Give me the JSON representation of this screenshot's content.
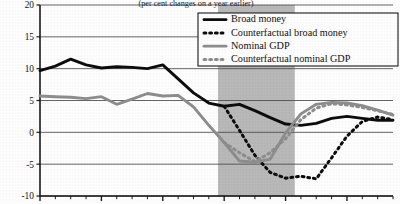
{
  "chart_data": {
    "type": "line",
    "title": "",
    "subtitle": "(per cent changes on a year earlier)",
    "xlabel": "",
    "ylabel": "",
    "xlim": [
      2006.0,
      2011.75
    ],
    "ylim": [
      -10,
      20
    ],
    "yticks": [
      20,
      15,
      10,
      5,
      0,
      -5,
      -10
    ],
    "ytick_labels": [
      "20",
      "15",
      "10",
      "5",
      "0",
      "-5",
      "-10"
    ],
    "xticks": [
      2006,
      2007,
      2008,
      2009,
      2010,
      2011
    ],
    "xtick_labels": [
      "2006",
      "2007",
      "2008",
      "2009",
      "2010",
      "2011"
    ],
    "minor_xtick_interval": 0.25,
    "grid": "horizontal",
    "legend_position": "top-right",
    "shaded_band": {
      "label": "recession",
      "x_start": 2008.9,
      "x_end": 2010.15,
      "color": "#b9b9b9"
    },
    "series": [
      {
        "name": "Broad money",
        "style": "solid",
        "color": "#0d0d0d",
        "width": 2.9,
        "x": [
          2006.0,
          2006.25,
          2006.5,
          2006.75,
          2007.0,
          2007.25,
          2007.5,
          2007.75,
          2008.0,
          2008.25,
          2008.5,
          2008.75,
          2009.0,
          2009.25,
          2009.5,
          2009.75,
          2010.0,
          2010.25,
          2010.5,
          2010.75,
          2011.0,
          2011.25,
          2011.5,
          2011.75
        ],
        "values": [
          9.7,
          10.4,
          11.5,
          10.6,
          10.1,
          10.3,
          10.2,
          10.0,
          10.6,
          8.4,
          6.2,
          4.6,
          4.1,
          4.4,
          3.4,
          2.3,
          1.3,
          1.1,
          1.4,
          2.2,
          2.5,
          2.2,
          1.9,
          1.9
        ]
      },
      {
        "name": "Counterfactual broad money",
        "style": "dotted",
        "color": "#0d0d0d",
        "width": 3.0,
        "x": [
          2009.0,
          2009.25,
          2009.5,
          2009.75,
          2010.0,
          2010.25,
          2010.5,
          2010.75,
          2011.0,
          2011.25,
          2011.5,
          2011.75
        ],
        "values": [
          4.1,
          0.3,
          -3.6,
          -6.3,
          -7.2,
          -6.9,
          -7.3,
          -4.0,
          -0.6,
          1.7,
          2.4,
          2.0
        ]
      },
      {
        "name": "Nominal GDP",
        "style": "solid",
        "color": "#8e8e8e",
        "width": 2.9,
        "x": [
          2006.0,
          2006.25,
          2006.5,
          2006.75,
          2007.0,
          2007.25,
          2007.5,
          2007.75,
          2008.0,
          2008.25,
          2008.5,
          2008.75,
          2009.0,
          2009.25,
          2009.5,
          2009.75,
          2010.0,
          2010.25,
          2010.5,
          2010.75,
          2011.0,
          2011.25,
          2011.5,
          2011.75
        ],
        "values": [
          5.7,
          5.6,
          5.5,
          5.3,
          5.6,
          4.4,
          5.2,
          6.1,
          5.7,
          5.8,
          4.0,
          1.1,
          -1.6,
          -4.5,
          -4.7,
          -4.2,
          -0.1,
          2.9,
          4.4,
          4.7,
          4.6,
          4.2,
          3.5,
          2.7
        ]
      },
      {
        "name": "Counterfactual nominal GDP",
        "style": "dotted",
        "color": "#8e8e8e",
        "width": 3.0,
        "x": [
          2009.0,
          2009.25,
          2009.5,
          2009.75,
          2010.0,
          2010.25,
          2010.5,
          2010.75,
          2011.0,
          2011.25,
          2011.5,
          2011.75
        ],
        "values": [
          -1.6,
          -3.2,
          -4.6,
          -3.2,
          -1.0,
          2.0,
          3.8,
          4.5,
          4.3,
          3.9,
          3.4,
          2.8
        ]
      }
    ]
  },
  "legend": {
    "entries": [
      {
        "label": "Broad money"
      },
      {
        "label": "Counterfactual broad money"
      },
      {
        "label": "Nominal GDP"
      },
      {
        "label": "Counterfactual nominal GDP"
      }
    ]
  },
  "colors": {
    "series_dark": "#0d0d0d",
    "series_gray": "#8e8e8e",
    "band": "#b9b9b9",
    "axis": "#1a1a1a",
    "grid": "#4a4a4a",
    "background": "#ffffff"
  }
}
